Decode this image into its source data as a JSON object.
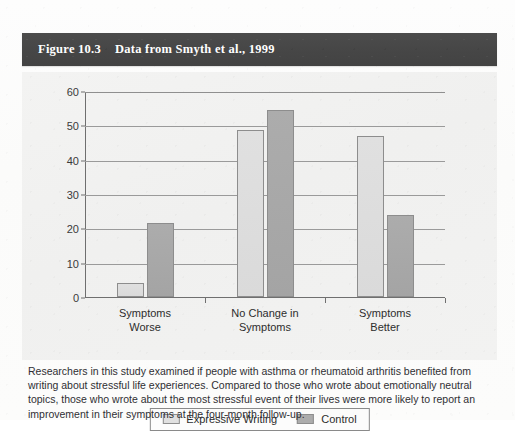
{
  "page": {
    "top_partial_text": "..."
  },
  "figure": {
    "number_label": "Figure 10.3",
    "title": "Data from Smyth et al., 1999",
    "caption": "Researchers in this study examined if people with asthma or rheumatoid arthritis benefited from writing about stressful life experiences. Compared to those who wrote about emotionally neutral topics, those who wrote about the most stressful event of their lives were more likely to report an improvement in their symptoms at the four-month follow-up."
  },
  "colors": {
    "header_bar": "#464646",
    "header_text": "#ffffff",
    "panel_background": "#f1f1f0",
    "expressive_writing_bar": "#dcdcdc",
    "control_bar": "#a8a8a8",
    "bar_border": "#8d8d8d",
    "gridline": "#9a9a9a",
    "axis": "#6f6f6f",
    "caption_text": "#2f2f33"
  },
  "chart_data": {
    "type": "bar",
    "title": "Data from Smyth et al., 1999",
    "xlabel": "",
    "ylabel": "",
    "categories": [
      "Symptoms Worse",
      "No Change in Symptoms",
      "Symptoms Better"
    ],
    "category_lines": [
      [
        "Symptoms",
        "Worse"
      ],
      [
        "No Change in",
        "Symptoms"
      ],
      [
        "Symptoms",
        "Better"
      ]
    ],
    "series": [
      {
        "name": "Expressive Writing",
        "values": [
          4,
          48.5,
          47
        ]
      },
      {
        "name": "Control",
        "values": [
          21.5,
          54.5,
          24
        ]
      }
    ],
    "ylim": [
      0,
      60
    ],
    "yticks": [
      0,
      10,
      20,
      30,
      40,
      50,
      60
    ],
    "ytick_labels": [
      "0",
      "10",
      "20",
      "30",
      "40",
      "50",
      "60"
    ],
    "grid": true,
    "grid_axis": "y",
    "legend_position": "bottom-center"
  }
}
